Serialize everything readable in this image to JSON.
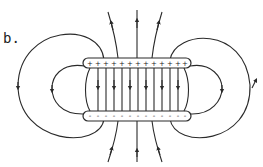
{
  "figure": {
    "label": "b.",
    "top_plate": {
      "charge_sign": "+",
      "charge_count": 14
    },
    "bottom_plate": {
      "charge_sign": "-",
      "charge_count": 14
    },
    "colors": {
      "line": "#2a2a2a",
      "background": "#ffffff"
    }
  }
}
